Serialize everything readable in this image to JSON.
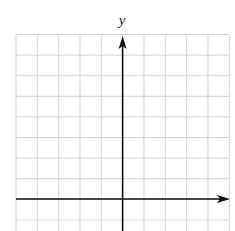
{
  "diagram": {
    "type": "coordinate-grid",
    "y_axis_label": "y",
    "x_axis_label": "",
    "grid": {
      "columns": 10,
      "rows_visible": 9.3,
      "left": 16,
      "right": 229.3,
      "top": 34.5,
      "bottom": 231,
      "col_spacing": 21.33,
      "row_spacing": 20.6,
      "line_color": "#d2d2d2"
    },
    "axes": {
      "color": "#111111",
      "origin_x": 122.6,
      "origin_y": 199,
      "x_arrow_tip": 230,
      "y_arrow_tip": 36
    }
  }
}
